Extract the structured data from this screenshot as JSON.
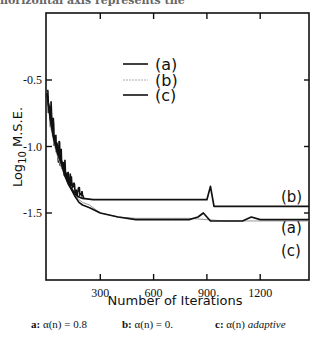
{
  "page": {
    "header_snippet": "horizontal axis represents the"
  },
  "chart_data": {
    "type": "line",
    "title": "",
    "xlabel": "Number of Iterations",
    "ylabel": "Log10 M.S.E.",
    "ylabel_parts": {
      "main": "Log",
      "sub": "10",
      "rest": " M.S.E."
    },
    "xlim": [
      0,
      1475
    ],
    "ylim": [
      -1.75,
      -0.25
    ],
    "xticks": [
      300,
      600,
      900,
      1200
    ],
    "xtick_labels": [
      "300",
      "600",
      "900",
      "1200"
    ],
    "yticks": [
      -0.5,
      -1.0,
      -1.5
    ],
    "ytick_labels": [
      "-0.5",
      "-1.0",
      "-1.5"
    ],
    "grid": false,
    "legend_position": "upper center",
    "legend": [
      {
        "key": "a",
        "label": "(a)",
        "style": "solid-black"
      },
      {
        "key": "b",
        "label": "(b)",
        "style": "dotted-gray"
      },
      {
        "key": "c",
        "label": "(c)",
        "style": "solid-black"
      }
    ],
    "curve_labels": [
      {
        "key": "b",
        "label": "(b)",
        "x": 1360,
        "y": -1.44
      },
      {
        "key": "a",
        "label": "(a)",
        "x": 1360,
        "y": -1.62
      },
      {
        "key": "c",
        "label": "(c)",
        "x": 1360,
        "y": -1.78
      }
    ],
    "series": [
      {
        "name": "(a)",
        "color": "#111111",
        "x": [
          0,
          20,
          40,
          60,
          80,
          100,
          120,
          140,
          160,
          180,
          200,
          240,
          300,
          400,
          500,
          600,
          700,
          800,
          850,
          880,
          900,
          920,
          1000,
          1100,
          1150,
          1200,
          1475
        ],
        "y": [
          -0.6,
          -0.8,
          -0.95,
          -1.05,
          -1.1,
          -1.2,
          -1.28,
          -1.33,
          -1.38,
          -1.42,
          -1.44,
          -1.46,
          -1.5,
          -1.53,
          -1.55,
          -1.55,
          -1.55,
          -1.55,
          -1.53,
          -1.5,
          -1.53,
          -1.56,
          -1.56,
          -1.56,
          -1.53,
          -1.55,
          -1.55
        ]
      },
      {
        "name": "(b)",
        "color": "#999999",
        "x": [
          0,
          20,
          40,
          60,
          80,
          100,
          120,
          140,
          160,
          180,
          200,
          240,
          300,
          400,
          500,
          600,
          700,
          800,
          900,
          1000,
          1200,
          1475
        ],
        "y": [
          -0.6,
          -0.85,
          -0.98,
          -1.08,
          -1.15,
          -1.22,
          -1.28,
          -1.33,
          -1.37,
          -1.4,
          -1.42,
          -1.44,
          -1.5,
          -1.53,
          -1.54,
          -1.54,
          -1.54,
          -1.54,
          -1.55,
          -1.56,
          -1.56,
          -1.56
        ]
      },
      {
        "name": "(c)",
        "color": "#111111",
        "x": [
          0,
          20,
          40,
          60,
          80,
          100,
          120,
          140,
          160,
          180,
          200,
          260,
          300,
          400,
          500,
          600,
          700,
          800,
          900,
          920,
          940,
          1000,
          1100,
          1180,
          1200,
          1230,
          1260,
          1475
        ],
        "y": [
          -0.6,
          -0.8,
          -0.95,
          -1.05,
          -1.12,
          -1.22,
          -1.28,
          -1.32,
          -1.36,
          -1.38,
          -1.39,
          -1.4,
          -1.4,
          -1.4,
          -1.4,
          -1.4,
          -1.4,
          -1.4,
          -1.4,
          -1.3,
          -1.45,
          -1.45,
          -1.45,
          -1.45,
          -1.45,
          -1.45,
          -1.45,
          -1.45
        ]
      }
    ]
  },
  "caption": {
    "a": {
      "label": "a:",
      "expr": "α(n) = 0.8"
    },
    "b": {
      "label": "b:",
      "expr": "α(n) = 0."
    },
    "c": {
      "label": "c:",
      "expr": "α(n)",
      "note": "adaptive"
    }
  }
}
